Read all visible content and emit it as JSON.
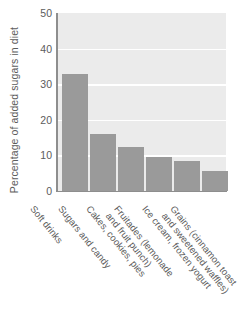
{
  "chart_data": {
    "type": "bar",
    "title": "",
    "xlabel": "",
    "ylabel": "Percentage of added sugars in diet",
    "ylim": [
      0,
      50
    ],
    "yticks": [
      0,
      10,
      20,
      30,
      40,
      50
    ],
    "grid": "horizontal-only",
    "legend": "none",
    "categories": [
      "Soft drinks",
      "Sugars and candy",
      "Cakes, cookies, pies",
      "Fruitades (lemonade and fruit punch)",
      "Ice cream, frozen yogurt",
      "Grains (cinnamon toast and sweetened waffles)"
    ],
    "category_lines": [
      [
        "Soft drinks",
        ""
      ],
      [
        "Sugars and candy",
        ""
      ],
      [
        "Cakes, cookies, pies",
        ""
      ],
      [
        "Fruitades (lemonade",
        "and fruit punch)"
      ],
      [
        "Ice cream, frozen yogurt",
        ""
      ],
      [
        "Grains (cinnamon toast",
        "and sweetened waffles)"
      ]
    ],
    "values": [
      33,
      16,
      12.5,
      9.5,
      8.5,
      5.5
    ],
    "colors": {
      "bar_fill": "#9a9a9a",
      "plot_background": "#ebebeb",
      "gridline": "#ffffff",
      "axis": "#8e8e8e",
      "text": "#5c5c5c",
      "page_background": "#ffffff"
    }
  },
  "axis": {
    "y_title": "Percentage of added sugars in diet",
    "tick_labels": [
      "0",
      "10",
      "20",
      "30",
      "40",
      "50"
    ]
  }
}
